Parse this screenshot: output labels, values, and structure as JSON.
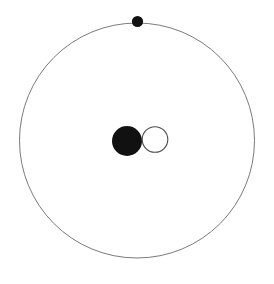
{
  "figure": {
    "title": "",
    "caption": "",
    "background_color": "#ffffff",
    "width": 274,
    "height": 284
  },
  "chart_data": {
    "type": "scatter",
    "title": "",
    "subtitle": "",
    "xlabel": "",
    "ylabel": "",
    "xlim": [
      0,
      274
    ],
    "ylim": [
      0,
      284
    ],
    "grid": false,
    "legend": "none",
    "elements": [
      {
        "name": "orbit-path",
        "shape": "circle",
        "fill": "none",
        "stroke": "#6b6b6b",
        "stroke_width": 0.9,
        "cx": 137,
        "cy": 140.5,
        "r": 117.5
      },
      {
        "name": "orbiting-body",
        "shape": "circle",
        "fill": "#111111",
        "stroke": "none",
        "stroke_width": 0,
        "cx": 137.5,
        "cy": 21.5,
        "r": 5.6
      },
      {
        "name": "primary-body",
        "shape": "circle",
        "fill": "#111111",
        "stroke": "none",
        "stroke_width": 0,
        "cx": 127,
        "cy": 141,
        "r": 15
      },
      {
        "name": "secondary-body",
        "shape": "circle",
        "fill": "#ffffff",
        "stroke": "#4a4a4a",
        "stroke_width": 1.1,
        "cx": 155,
        "cy": 139.5,
        "r": 12.8
      }
    ]
  },
  "colors": {
    "background": "#ffffff",
    "body_fill": "#111111",
    "orbit_stroke": "#6b6b6b",
    "open_stroke": "#4a4a4a"
  },
  "labels": {
    "orbit_path": "orbit path",
    "orbiting_body": "orbiting body",
    "primary_body": "primary body",
    "secondary_body": "secondary body"
  }
}
